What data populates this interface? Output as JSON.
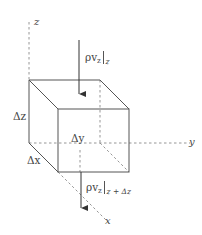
{
  "diagram": {
    "type": "control-volume-cube",
    "axes": {
      "z": "z",
      "y": "y",
      "x": "x"
    },
    "dimensions": {
      "dz": "Δz",
      "dy": "Δy",
      "dx": "Δx"
    },
    "fluxes": {
      "top": {
        "symbol": "ρv",
        "subscript": "z",
        "evaluated_at": "z"
      },
      "bottom": {
        "symbol": "ρv",
        "subscript": "z",
        "evaluated_at": "z + Δz"
      }
    },
    "colors": {
      "line": "#555555",
      "dashed": "#8a8a8a",
      "text": "#444444",
      "background": "#ffffff"
    }
  }
}
